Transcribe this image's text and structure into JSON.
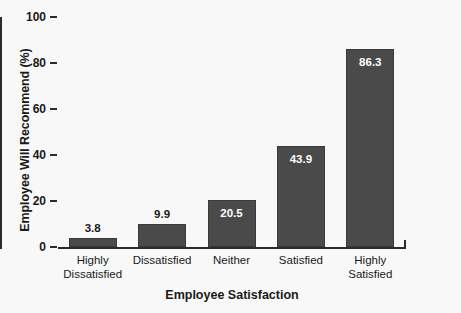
{
  "chart_data": {
    "type": "bar",
    "title": "",
    "xlabel": "Employee Satisfaction",
    "ylabel": "Employee Will Recommend (%)",
    "categories": [
      "Highly Dissatisfied",
      "Dissatisfied",
      "Neither",
      "Satisfied",
      "Highly Satisfied"
    ],
    "category_lines": [
      [
        "Highly",
        "Dissatisfied"
      ],
      [
        "Dissatisfied"
      ],
      [
        "Neither"
      ],
      [
        "Satisfied"
      ],
      [
        "Highly",
        "Satisfied"
      ]
    ],
    "values": [
      3.8,
      9.9,
      20.5,
      43.9,
      86.3
    ],
    "value_labels": [
      "3.8",
      "9.9",
      "20.5",
      "43.9",
      "86.3"
    ],
    "ylim": [
      0,
      100
    ],
    "yticks": [
      0,
      20,
      40,
      60,
      80,
      100
    ],
    "ytick_labels": [
      "0",
      "20",
      "40",
      "60",
      "80",
      "100"
    ],
    "grid": false,
    "legend": false,
    "bar_color": "#4a4a4a",
    "background_color": "#f8f8f8",
    "axis_color": "#2b2b2b",
    "label_color_inside": "#ffffff",
    "label_color_outside": "#1a1a1a"
  }
}
